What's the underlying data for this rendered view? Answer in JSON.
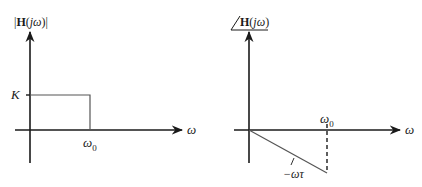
{
  "diagram": {
    "type": "frequency-response",
    "colors": {
      "axis": "#1a1a1a",
      "curve": "#555555",
      "background": "#ffffff"
    },
    "magnitude_plot": {
      "y_label": {
        "prefix": "|",
        "bold": "H",
        "paren_open": "(",
        "var": "jω",
        "paren_close": ")",
        "suffix": "|"
      },
      "x_label": "ω",
      "level_label": "K",
      "cutoff_label": {
        "main": "ω",
        "sub": "0"
      },
      "description": "Ideal lowpass: magnitude K for 0 ≤ ω < ω0, zero beyond"
    },
    "phase_plot": {
      "y_label": {
        "angle": "∠",
        "bold": "H",
        "paren_open": "(",
        "var": "jω",
        "paren_close": ")"
      },
      "x_label": "ω",
      "slope_label": "−ωτ",
      "cutoff_label": {
        "main": "ω",
        "sub": "0"
      },
      "description": "Linear phase −ωτ from 0 to ω0, dashed drop at ω0"
    }
  }
}
